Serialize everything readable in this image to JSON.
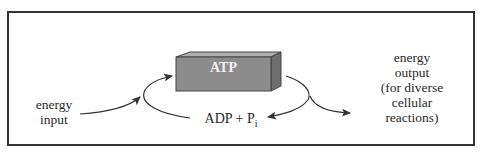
{
  "diagram": {
    "atp_label": "ATP",
    "adp_label": "ADP + P",
    "adp_subscript": "i",
    "input_label_line1": "energy",
    "input_label_line2": "input",
    "output_label_lines": [
      "energy",
      "output",
      "(for diverse",
      "cellular",
      "reactions)"
    ],
    "colors": {
      "box_front": "#8c8c8c",
      "box_top": "#b0b0b0",
      "box_side": "#6e6e6e",
      "frame": "#333333",
      "arrow": "#333333"
    }
  }
}
